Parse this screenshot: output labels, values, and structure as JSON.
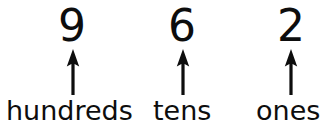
{
  "figure": {
    "background_color": "#ffffff",
    "ink_color": "#0d0d0d",
    "number": "962"
  },
  "columns": [
    {
      "digit": "9",
      "label": "hundreds",
      "arrow_icon": "arrow-up-icon"
    },
    {
      "digit": "6",
      "label": "tens",
      "arrow_icon": "arrow-up-icon"
    },
    {
      "digit": "2",
      "label": "ones",
      "arrow_icon": "arrow-up-icon"
    }
  ]
}
